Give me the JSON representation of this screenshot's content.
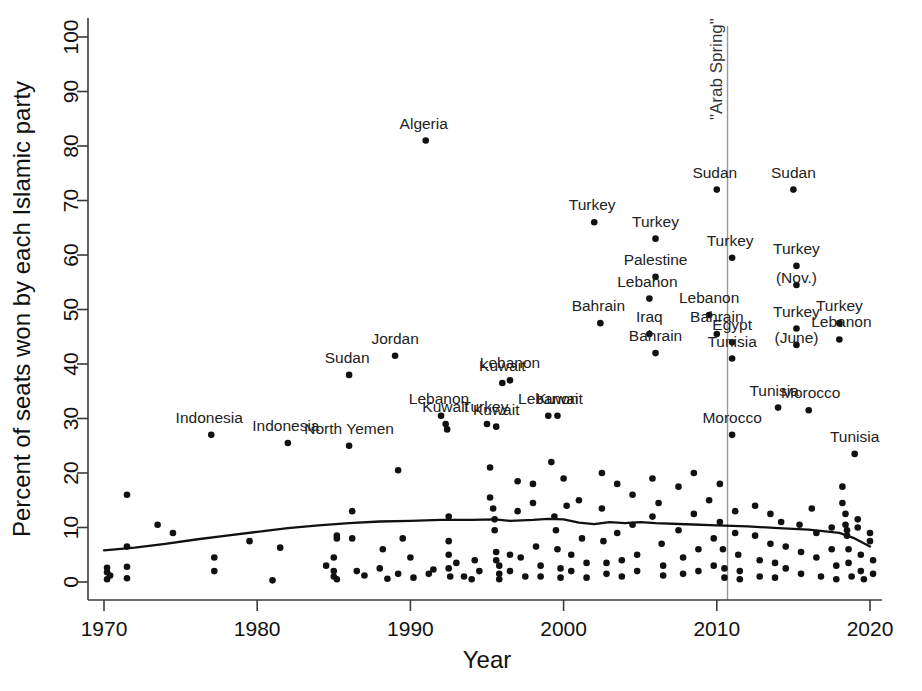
{
  "chart_data": {
    "type": "scatter",
    "title": "",
    "xlabel": "Year",
    "ylabel": "Percent of seats won by each Islamic party",
    "xlim": [
      1969,
      2021
    ],
    "ylim": [
      0,
      100
    ],
    "xticks": [
      1970,
      1980,
      1990,
      2000,
      2010,
      2020
    ],
    "xticklabels": [
      "1970",
      "1980",
      "1990",
      "2000",
      "2010",
      "2020"
    ],
    "yticks": [
      0,
      10,
      20,
      30,
      40,
      50,
      60,
      70,
      80,
      90,
      100
    ],
    "yticklabels": [
      "0",
      "10",
      "20",
      "30",
      "40",
      "50",
      "60",
      "70",
      "80",
      "90",
      "100"
    ],
    "grid": false,
    "legend": false,
    "marker_color": "#111111",
    "trend_color": "#111111",
    "annotations": [
      {
        "name": "arab-spring-line",
        "type": "vline",
        "x": 2010.7,
        "label": "\"Arab Spring\"",
        "orientation": "vertical",
        "color": "#999999"
      }
    ],
    "labeled_points": [
      {
        "label": "Indonesia",
        "x": 1977.0,
        "y": 27.0,
        "dx": -2,
        "dy": -12
      },
      {
        "label": "Indonesia",
        "x": 1982.0,
        "y": 25.5,
        "dx": -2,
        "dy": -12
      },
      {
        "label": "North Yemen",
        "x": 1986.0,
        "y": 25.0,
        "dx": 0,
        "dy": -12
      },
      {
        "label": "Sudan",
        "x": 1986.0,
        "y": 38.0,
        "dx": -2,
        "dy": -12
      },
      {
        "label": "Jordan",
        "x": 1989.0,
        "y": 41.5,
        "dx": 0,
        "dy": -12
      },
      {
        "label": "Algeria",
        "x": 1991.0,
        "y": 81.0,
        "dx": -2,
        "dy": -12
      },
      {
        "label": "Lebanon",
        "x": 1992.0,
        "y": 30.5,
        "dx": -2,
        "dy": -12
      },
      {
        "label": "Kuwait",
        "x": 1992.3,
        "y": 29.0,
        "dx": 0,
        "dy": -12
      },
      {
        "label": "Turkey",
        "x": 1995.0,
        "y": 29.0,
        "dx": -2,
        "dy": -12
      },
      {
        "label": "Kuwait",
        "x": 1995.6,
        "y": 28.5,
        "dx": 0,
        "dy": -12
      },
      {
        "label": "Kuwait",
        "x": 1996.0,
        "y": 36.5,
        "dx": 0,
        "dy": -12
      },
      {
        "label": "Lebanon",
        "x": 1996.5,
        "y": 37.0,
        "dx": 0,
        "dy": -12
      },
      {
        "label": "Lebanon",
        "x": 1999.0,
        "y": 30.5,
        "dx": 0,
        "dy": -12
      },
      {
        "label": "Kuwait",
        "x": 1999.6,
        "y": 30.5,
        "dx": 2,
        "dy": -12
      },
      {
        "label": "Turkey",
        "x": 2002.0,
        "y": 66.0,
        "dx": -2,
        "dy": -12
      },
      {
        "label": "Bahrain",
        "x": 2002.4,
        "y": 47.5,
        "dx": -2,
        "dy": -12
      },
      {
        "label": "Turkey",
        "x": 2006.0,
        "y": 63.0,
        "dx": 0,
        "dy": -12
      },
      {
        "label": "Palestine",
        "x": 2006.0,
        "y": 56.0,
        "dx": 0,
        "dy": -12
      },
      {
        "label": "Lebanon",
        "x": 2005.6,
        "y": 52.0,
        "dx": -2,
        "dy": -12
      },
      {
        "label": "Iraq",
        "x": 2005.6,
        "y": 45.5,
        "dx": 0,
        "dy": -12
      },
      {
        "label": "Bahrain",
        "x": 2006.0,
        "y": 42.0,
        "dx": 0,
        "dy": -12
      },
      {
        "label": "Sudan",
        "x": 2010.0,
        "y": 72.0,
        "dx": -2,
        "dy": -12
      },
      {
        "label": "Turkey",
        "x": 2011.0,
        "y": 59.5,
        "dx": -2,
        "dy": -12
      },
      {
        "label": "Lebanon",
        "x": 2009.5,
        "y": 49.0,
        "dx": 0,
        "dy": -12
      },
      {
        "label": "Bahrain",
        "x": 2010.0,
        "y": 45.5,
        "dx": 0,
        "dy": -12
      },
      {
        "label": "Egypt",
        "x": 2011.0,
        "y": 44.0,
        "dx": 0,
        "dy": -12
      },
      {
        "label": "Tunisia",
        "x": 2011.0,
        "y": 41.0,
        "dx": 0,
        "dy": -12
      },
      {
        "label": "Morocco",
        "x": 2011.0,
        "y": 27.0,
        "dx": 0,
        "dy": -12
      },
      {
        "label": "Sudan",
        "x": 2015.0,
        "y": 72.0,
        "dx": 0,
        "dy": -12
      },
      {
        "label": "Turkey",
        "x": 2015.2,
        "y": 58.0,
        "dx": 0,
        "dy": -12
      },
      {
        "label": "(Nov.)",
        "x": 2015.2,
        "y": 54.5,
        "dx": 0,
        "dy": -2
      },
      {
        "label": "Turkey",
        "x": 2015.2,
        "y": 46.5,
        "dx": 0,
        "dy": -12
      },
      {
        "label": "(June)",
        "x": 2015.2,
        "y": 43.5,
        "dx": 0,
        "dy": -2
      },
      {
        "label": "Turkey",
        "x": 2018.0,
        "y": 47.5,
        "dx": 0,
        "dy": -12
      },
      {
        "label": "Lebanon",
        "x": 2018.0,
        "y": 44.5,
        "dx": 2,
        "dy": -12
      },
      {
        "label": "Tunisia",
        "x": 2014.0,
        "y": 32.0,
        "dx": -4,
        "dy": -12
      },
      {
        "label": "Morocco",
        "x": 2016.0,
        "y": 31.5,
        "dx": 2,
        "dy": -12
      },
      {
        "label": "Tunisia",
        "x": 2019.0,
        "y": 23.5,
        "dx": 0,
        "dy": -12
      }
    ],
    "trend_line": [
      [
        1970.0,
        5.8
      ],
      [
        1972.0,
        6.3
      ],
      [
        1974.0,
        7.0
      ],
      [
        1976.0,
        7.8
      ],
      [
        1978.0,
        8.5
      ],
      [
        1980.0,
        9.2
      ],
      [
        1982.0,
        9.9
      ],
      [
        1984.0,
        10.4
      ],
      [
        1986.0,
        10.8
      ],
      [
        1988.0,
        11.1
      ],
      [
        1990.0,
        11.2
      ],
      [
        1992.0,
        11.4
      ],
      [
        1994.0,
        11.4
      ],
      [
        1995.5,
        11.5
      ],
      [
        1996.5,
        11.2
      ],
      [
        1998.0,
        11.4
      ],
      [
        1999.0,
        11.6
      ],
      [
        2000.0,
        11.5
      ],
      [
        2001.0,
        10.9
      ],
      [
        2002.0,
        10.6
      ],
      [
        2003.0,
        11.0
      ],
      [
        2004.0,
        10.8
      ],
      [
        2005.0,
        11.0
      ],
      [
        2006.0,
        10.8
      ],
      [
        2008.0,
        10.6
      ],
      [
        2010.0,
        10.4
      ],
      [
        2012.0,
        10.2
      ],
      [
        2014.0,
        9.9
      ],
      [
        2016.0,
        9.6
      ],
      [
        2018.0,
        9.0
      ],
      [
        2019.0,
        8.0
      ],
      [
        2020.0,
        6.5
      ]
    ],
    "points": [
      [
        1970.2,
        0.5
      ],
      [
        1970.2,
        1.8
      ],
      [
        1970.2,
        2.6
      ],
      [
        1970.4,
        1.2
      ],
      [
        1971.5,
        0.7
      ],
      [
        1971.5,
        2.8
      ],
      [
        1971.5,
        6.5
      ],
      [
        1971.5,
        16.0
      ],
      [
        1973.5,
        10.5
      ],
      [
        1974.5,
        9.0
      ],
      [
        1977.0,
        27.0
      ],
      [
        1977.2,
        4.5
      ],
      [
        1977.2,
        2.0
      ],
      [
        1979.5,
        7.5
      ],
      [
        1981.0,
        0.3
      ],
      [
        1981.5,
        6.3
      ],
      [
        1982.0,
        25.5
      ],
      [
        1984.5,
        3.0
      ],
      [
        1985.0,
        1.0
      ],
      [
        1985.0,
        2.0
      ],
      [
        1985.0,
        4.5
      ],
      [
        1985.2,
        0.5
      ],
      [
        1985.2,
        8.5
      ],
      [
        1985.2,
        8.0
      ],
      [
        1986.0,
        38.0
      ],
      [
        1986.0,
        25.0
      ],
      [
        1986.2,
        13.0
      ],
      [
        1986.2,
        8.0
      ],
      [
        1986.5,
        2.0
      ],
      [
        1987.0,
        1.2
      ],
      [
        1988.0,
        2.5
      ],
      [
        1988.2,
        6.0
      ],
      [
        1988.5,
        0.6
      ],
      [
        1989.0,
        41.5
      ],
      [
        1989.2,
        20.5
      ],
      [
        1989.2,
        1.5
      ],
      [
        1989.5,
        8.0
      ],
      [
        1990.0,
        4.5
      ],
      [
        1990.2,
        0.8
      ],
      [
        1991.0,
        81.0
      ],
      [
        1991.2,
        1.5
      ],
      [
        1991.5,
        2.3
      ],
      [
        1992.0,
        30.5
      ],
      [
        1992.3,
        29.0
      ],
      [
        1992.4,
        28.0
      ],
      [
        1992.5,
        12.0
      ],
      [
        1992.5,
        7.5
      ],
      [
        1992.5,
        5.0
      ],
      [
        1992.5,
        2.5
      ],
      [
        1992.6,
        1.0
      ],
      [
        1993.0,
        3.5
      ],
      [
        1993.5,
        1.0
      ],
      [
        1994.0,
        0.5
      ],
      [
        1994.2,
        4.0
      ],
      [
        1994.5,
        2.0
      ],
      [
        1995.0,
        29.0
      ],
      [
        1995.2,
        21.0
      ],
      [
        1995.2,
        15.5
      ],
      [
        1995.4,
        13.5
      ],
      [
        1995.5,
        11.5
      ],
      [
        1995.5,
        9.5
      ],
      [
        1995.6,
        28.5
      ],
      [
        1995.6,
        5.5
      ],
      [
        1995.6,
        4.0
      ],
      [
        1995.8,
        3.0
      ],
      [
        1995.8,
        1.5
      ],
      [
        1995.8,
        0.5
      ],
      [
        1996.0,
        36.5
      ],
      [
        1996.5,
        37.0
      ],
      [
        1996.5,
        5.0
      ],
      [
        1996.5,
        2.0
      ],
      [
        1997.0,
        18.5
      ],
      [
        1997.0,
        13.0
      ],
      [
        1997.2,
        4.5
      ],
      [
        1997.5,
        1.0
      ],
      [
        1998.0,
        18.0
      ],
      [
        1998.0,
        14.5
      ],
      [
        1998.2,
        6.5
      ],
      [
        1998.5,
        3.0
      ],
      [
        1998.5,
        1.0
      ],
      [
        1999.0,
        30.5
      ],
      [
        1999.2,
        22.0
      ],
      [
        1999.4,
        12.0
      ],
      [
        1999.5,
        9.5
      ],
      [
        1999.6,
        30.5
      ],
      [
        1999.6,
        6.0
      ],
      [
        1999.8,
        2.5
      ],
      [
        1999.8,
        0.8
      ],
      [
        2000.0,
        19.0
      ],
      [
        2000.2,
        14.0
      ],
      [
        2000.5,
        5.0
      ],
      [
        2000.5,
        2.0
      ],
      [
        2001.0,
        15.0
      ],
      [
        2001.2,
        8.0
      ],
      [
        2001.5,
        3.5
      ],
      [
        2001.5,
        0.8
      ],
      [
        2002.0,
        66.0
      ],
      [
        2002.4,
        47.5
      ],
      [
        2002.5,
        20.0
      ],
      [
        2002.5,
        13.5
      ],
      [
        2002.6,
        7.5
      ],
      [
        2002.8,
        3.5
      ],
      [
        2002.8,
        1.5
      ],
      [
        2003.5,
        18.0
      ],
      [
        2003.5,
        9.0
      ],
      [
        2003.8,
        4.0
      ],
      [
        2003.8,
        1.0
      ],
      [
        2004.5,
        16.0
      ],
      [
        2004.5,
        10.5
      ],
      [
        2004.8,
        5.0
      ],
      [
        2004.8,
        2.0
      ],
      [
        2005.6,
        52.0
      ],
      [
        2005.6,
        45.5
      ],
      [
        2005.8,
        19.0
      ],
      [
        2005.8,
        12.0
      ],
      [
        2006.0,
        63.0
      ],
      [
        2006.0,
        56.0
      ],
      [
        2006.0,
        42.0
      ],
      [
        2006.2,
        14.5
      ],
      [
        2006.4,
        7.0
      ],
      [
        2006.5,
        3.0
      ],
      [
        2006.5,
        1.2
      ],
      [
        2007.5,
        17.5
      ],
      [
        2007.5,
        9.5
      ],
      [
        2007.8,
        4.5
      ],
      [
        2007.8,
        1.5
      ],
      [
        2008.5,
        20.0
      ],
      [
        2008.5,
        12.5
      ],
      [
        2008.8,
        6.0
      ],
      [
        2008.8,
        2.0
      ],
      [
        2009.5,
        49.0
      ],
      [
        2009.5,
        15.0
      ],
      [
        2009.8,
        8.0
      ],
      [
        2009.8,
        3.0
      ],
      [
        2010.0,
        72.0
      ],
      [
        2010.0,
        45.5
      ],
      [
        2010.2,
        18.0
      ],
      [
        2010.2,
        11.0
      ],
      [
        2010.4,
        6.0
      ],
      [
        2010.5,
        2.5
      ],
      [
        2010.5,
        0.8
      ],
      [
        2011.0,
        59.5
      ],
      [
        2011.0,
        44.0
      ],
      [
        2011.0,
        41.0
      ],
      [
        2011.0,
        27.0
      ],
      [
        2011.2,
        13.0
      ],
      [
        2011.2,
        9.0
      ],
      [
        2011.4,
        5.0
      ],
      [
        2011.5,
        2.0
      ],
      [
        2011.5,
        0.5
      ],
      [
        2012.5,
        14.0
      ],
      [
        2012.5,
        8.5
      ],
      [
        2012.8,
        4.0
      ],
      [
        2012.8,
        1.0
      ],
      [
        2013.5,
        12.5
      ],
      [
        2013.5,
        7.0
      ],
      [
        2013.8,
        3.5
      ],
      [
        2013.8,
        0.8
      ],
      [
        2014.0,
        32.0
      ],
      [
        2014.2,
        11.0
      ],
      [
        2014.5,
        6.5
      ],
      [
        2014.5,
        2.5
      ],
      [
        2015.0,
        72.0
      ],
      [
        2015.2,
        58.0
      ],
      [
        2015.2,
        46.5
      ],
      [
        2015.4,
        10.5
      ],
      [
        2015.5,
        5.5
      ],
      [
        2015.5,
        1.5
      ],
      [
        2016.0,
        31.5
      ],
      [
        2016.2,
        13.5
      ],
      [
        2016.5,
        9.0
      ],
      [
        2016.5,
        4.5
      ],
      [
        2016.8,
        1.0
      ],
      [
        2017.5,
        10.0
      ],
      [
        2017.5,
        6.0
      ],
      [
        2017.8,
        3.0
      ],
      [
        2017.8,
        0.5
      ],
      [
        2018.0,
        47.5
      ],
      [
        2018.0,
        44.5
      ],
      [
        2018.2,
        17.5
      ],
      [
        2018.2,
        14.5
      ],
      [
        2018.4,
        12.5
      ],
      [
        2018.4,
        10.5
      ],
      [
        2018.5,
        9.5
      ],
      [
        2018.5,
        8.5
      ],
      [
        2018.6,
        6.0
      ],
      [
        2018.6,
        3.5
      ],
      [
        2018.8,
        1.0
      ],
      [
        2019.0,
        23.5
      ],
      [
        2019.2,
        11.5
      ],
      [
        2019.2,
        10.0
      ],
      [
        2019.4,
        5.0
      ],
      [
        2019.4,
        2.0
      ],
      [
        2019.6,
        0.5
      ],
      [
        2020.0,
        9.0
      ],
      [
        2020.0,
        7.5
      ],
      [
        2020.2,
        4.0
      ],
      [
        2020.2,
        1.5
      ]
    ]
  }
}
